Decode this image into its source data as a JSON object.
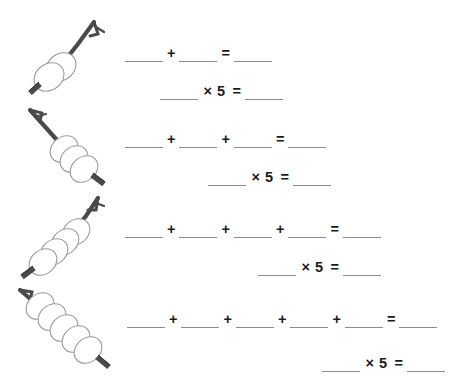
{
  "page": {
    "background_color": "#ffffff",
    "blank_color": "#8b8b8b",
    "text_color": "#1a1a1a",
    "stick_color": "#4a4a4a",
    "cocoon_outline_color": "#9a9a9a",
    "cocoon_fill_color": "#ffffff"
  },
  "symbols": {
    "plus": "+",
    "equals": "=",
    "multiply": "×",
    "blank": "",
    "multiplier": "5",
    "times_five": "× 5"
  },
  "problems": [
    {
      "index": 1,
      "illustration": {
        "name": "cocoons-on-stick",
        "cocoon_count": 2
      },
      "addition_line": {
        "addend_count": 2,
        "operators": [
          "+"
        ],
        "equals": "=",
        "result_blank": ""
      },
      "multiplication_line": {
        "factor_blank": "",
        "multiply_symbol": "×",
        "multiplier": "5",
        "equals": "=",
        "product_blank": ""
      }
    },
    {
      "index": 2,
      "illustration": {
        "name": "cocoons-on-stick",
        "cocoon_count": 3
      },
      "addition_line": {
        "addend_count": 3,
        "operators": [
          "+",
          "+"
        ],
        "equals": "=",
        "result_blank": ""
      },
      "multiplication_line": {
        "factor_blank": "",
        "multiply_symbol": "×",
        "multiplier": "5",
        "equals": "=",
        "product_blank": ""
      }
    },
    {
      "index": 3,
      "illustration": {
        "name": "cocoons-on-stick",
        "cocoon_count": 4
      },
      "addition_line": {
        "addend_count": 4,
        "operators": [
          "+",
          "+",
          "+"
        ],
        "equals": "=",
        "result_blank": ""
      },
      "multiplication_line": {
        "factor_blank": "",
        "multiply_symbol": "×",
        "multiplier": "5",
        "equals": "=",
        "product_blank": ""
      }
    },
    {
      "index": 4,
      "illustration": {
        "name": "cocoons-on-stick",
        "cocoon_count": 5
      },
      "addition_line": {
        "addend_count": 5,
        "operators": [
          "+",
          "+",
          "+",
          "+"
        ],
        "equals": "=",
        "result_blank": ""
      },
      "multiplication_line": {
        "factor_blank": "",
        "multiply_symbol": "×",
        "multiplier": "5",
        "equals": "=",
        "product_blank": ""
      }
    }
  ]
}
